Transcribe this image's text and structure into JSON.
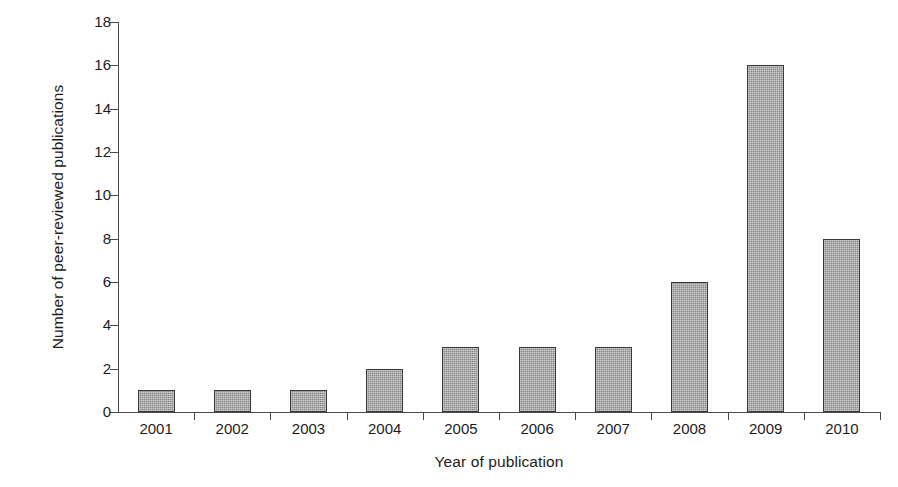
{
  "chart_data": {
    "type": "bar",
    "title": "",
    "xlabel": "Year of publication",
    "ylabel": "Number of peer-reviewed publications",
    "categories": [
      "2001",
      "2002",
      "2003",
      "2004",
      "2005",
      "2006",
      "2007",
      "2008",
      "2009",
      "2010"
    ],
    "values": [
      1,
      1,
      1,
      2,
      3,
      3,
      3,
      6,
      16,
      8
    ],
    "ylim": [
      0,
      18
    ],
    "ytick_labels": [
      "0",
      "2",
      "4",
      "6",
      "8",
      "10",
      "12",
      "14",
      "16",
      "18"
    ],
    "ytick_values": [
      0,
      2,
      4,
      6,
      8,
      10,
      12,
      14,
      16,
      18
    ],
    "ytick_step": 2,
    "grid": false,
    "legend": false,
    "legend_position": "none",
    "bar_color": "#8a8a8a",
    "bar_edge_color": "#3a3a3a",
    "axis_color": "#4a4a4a",
    "background_color": "#ffffff",
    "bar_fill_style": "dithered-gray-checker",
    "xtick_position": "category-boundaries"
  }
}
